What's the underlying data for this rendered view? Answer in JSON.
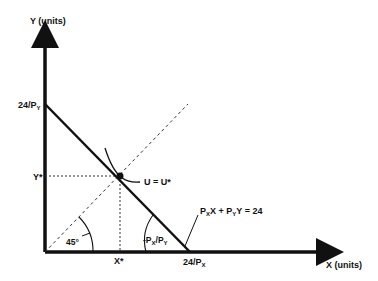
{
  "diagram": {
    "y_axis_label": "Y (units)",
    "x_axis_label": "X (units)",
    "y_intercept_label": {
      "base": "24/P",
      "sub": "Y"
    },
    "x_intercept_label": {
      "base": "24/P",
      "sub": "X"
    },
    "y_star_label": "Y*",
    "x_star_label": "X*",
    "utility_label": "U = U*",
    "budget_label": {
      "p1": "P",
      "s1": "X",
      "m1": "X + P",
      "s2": "Y",
      "m2": "Y = 24"
    },
    "slope_label": {
      "p1": "-P",
      "s1": "X",
      "m1": "/P",
      "s2": "Y"
    },
    "angle_label": "45°",
    "colors": {
      "ink": "#111111",
      "background": "#ffffff"
    }
  }
}
